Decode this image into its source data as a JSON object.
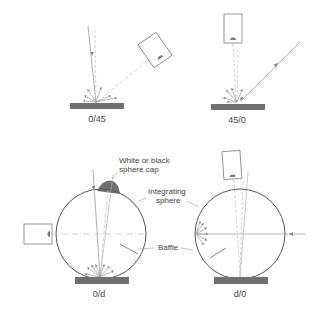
{
  "diagram": {
    "colors": {
      "line": "#9a9a9a",
      "dash": "#c2c2c2",
      "outline": "#555555",
      "sample": "#707070",
      "cap": "#707070",
      "text": "#444444"
    },
    "panels": [
      {
        "id": "0-45",
        "label": "0/45"
      },
      {
        "id": "45-0",
        "label": "45/0"
      },
      {
        "id": "0-d",
        "label": "0/d"
      },
      {
        "id": "d-0",
        "label": "d/0"
      }
    ],
    "annotations": {
      "cap_line1": "White or black",
      "cap_line2": "sphere cap",
      "sphere_line1": "Integrating",
      "sphere_line2": "sphere",
      "baffle": "Baffle"
    }
  }
}
